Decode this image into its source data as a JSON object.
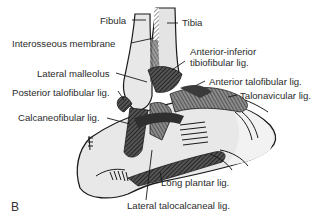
{
  "figure": {
    "panel_letter": "B",
    "colors": {
      "bone_fill": "#e6e6e6",
      "ligament_dark": "#333333",
      "ligament_mid": "#6a6a6a",
      "outline": "#1a1a1a",
      "label_text": "#2b2b2b",
      "background": "#ffffff"
    },
    "labels": [
      {
        "id": "fibula",
        "text": "Fibula"
      },
      {
        "id": "tibia",
        "text": "Tibia"
      },
      {
        "id": "interosseous-membrane",
        "text": "Interosseous membrane"
      },
      {
        "id": "anterior-inferior-tibiofibular-lig",
        "line1": "Anterior-inferior",
        "line2": "tibiofibular lig."
      },
      {
        "id": "lateral-malleolus",
        "text": "Lateral malleolus"
      },
      {
        "id": "anterior-talofibular-lig",
        "text": "Anterior talofibular lig."
      },
      {
        "id": "posterior-talofibular-lig",
        "text": "Posterior talofibular lig."
      },
      {
        "id": "talonavicular-lig",
        "text": "Talonavicular lig."
      },
      {
        "id": "calcaneofibular-lig",
        "text": "Calcaneofibular lig."
      },
      {
        "id": "long-plantar-lig",
        "text": "Long plantar lig."
      },
      {
        "id": "lateral-talocalcaneal-lig",
        "text": "Lateral talocalcaneal lig."
      }
    ]
  }
}
